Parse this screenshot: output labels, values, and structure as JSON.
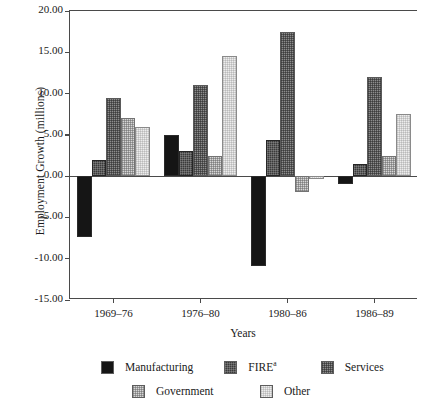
{
  "chart_data": {
    "type": "bar",
    "title": "",
    "xlabel": "Years",
    "ylabel": "Employment Growth (millions)",
    "categories": [
      "1969–76",
      "1976–80",
      "1980–86",
      "1986–89"
    ],
    "ylim": [
      -15.0,
      20.0
    ],
    "yticks": [
      20.0,
      15.0,
      10.0,
      5.0,
      0.0,
      -5.0,
      -10.0,
      -15.0
    ],
    "ytick_labels": [
      "20.00",
      "15.00",
      "10.00",
      "5.00",
      "0.00",
      "-5.00",
      "-10.00",
      "-15.00"
    ],
    "grid": false,
    "legend_position": "below-axes",
    "series": [
      {
        "name": "Manufacturing",
        "key": "manufacturing",
        "color": "#151515",
        "values": [
          -7.4,
          5.0,
          -10.9,
          -1.0
        ]
      },
      {
        "name": "FIRE",
        "key": "fire",
        "color": "#3a3a3a",
        "superscript": "a",
        "values": [
          2.0,
          3.0,
          4.4,
          1.5
        ]
      },
      {
        "name": "Services",
        "key": "services",
        "color": "#8d8d8d",
        "values": [
          9.5,
          11.0,
          17.5,
          12.0
        ]
      },
      {
        "name": "Government",
        "key": "government",
        "color": "#d7d7d7",
        "values": [
          7.0,
          2.4,
          -1.9,
          2.4
        ]
      },
      {
        "name": "Other",
        "key": "other",
        "color": "#ededed",
        "values": [
          6.0,
          14.6,
          -0.3,
          7.5
        ]
      }
    ]
  },
  "legend": {
    "items": [
      {
        "label": "Manufacturing",
        "key": "manufacturing",
        "superscript": ""
      },
      {
        "label": "FIRE",
        "key": "fire",
        "superscript": "a"
      },
      {
        "label": "Services",
        "key": "services",
        "superscript": ""
      },
      {
        "label": "Government",
        "key": "government",
        "superscript": ""
      },
      {
        "label": "Other",
        "key": "other",
        "superscript": ""
      }
    ]
  },
  "axes": {
    "y_title": "Employment Growth (millions)",
    "x_title": "Years"
  }
}
